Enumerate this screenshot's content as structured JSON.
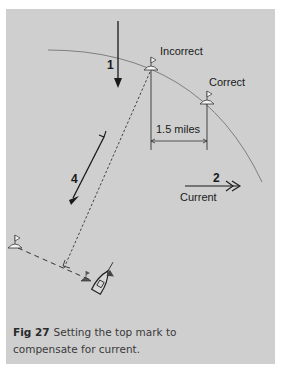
{
  "figure": {
    "labels": {
      "incorrect": "Incorrect",
      "correct": "Correct",
      "distance": "1.5 miles",
      "current": "Current",
      "step1": "1",
      "step2": "2",
      "step4": "4"
    },
    "icons": [
      "mark-buoy-icon",
      "boat-icon",
      "arrow-icon"
    ],
    "colors": {
      "panel": "#cfcfcf",
      "ink": "#1a1a1a",
      "caption": "#3a3a3a"
    },
    "caption": {
      "fig_label": "Fig 27",
      "text": "Setting the top mark to compensate for current."
    }
  }
}
